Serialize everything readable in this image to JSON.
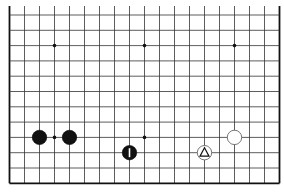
{
  "board": {
    "size": 19,
    "visible_columns": 19,
    "visible_rows": 12,
    "edges": {
      "left": true,
      "right": true,
      "bottom": true,
      "top": false
    },
    "grid": {
      "x0": 9.5,
      "x_step": 15.0,
      "y0": 15.0,
      "y_step": 15.3,
      "line_top_extent": 5
    },
    "line_color": "#333333",
    "edge_color": "#111111",
    "star_points": [
      {
        "col": 3,
        "row": 2
      },
      {
        "col": 9,
        "row": 2
      },
      {
        "col": 15,
        "row": 2
      },
      {
        "col": 3,
        "row": 8
      },
      {
        "col": 9,
        "row": 8
      }
    ],
    "stones": [
      {
        "color": "black",
        "col": 2,
        "row": 8,
        "mark": ""
      },
      {
        "color": "black",
        "col": 4,
        "row": 8,
        "mark": ""
      },
      {
        "color": "black",
        "col": 8,
        "row": 9,
        "mark": "bar"
      },
      {
        "color": "white",
        "col": 13,
        "row": 9,
        "mark": "triangle"
      },
      {
        "color": "white",
        "col": 15,
        "row": 8,
        "mark": ""
      }
    ]
  }
}
